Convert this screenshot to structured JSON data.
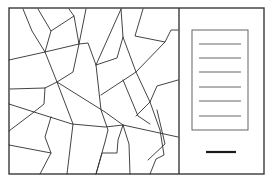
{
  "figure": {
    "width": 272,
    "height": 180,
    "background": "#ffffff",
    "line_color": "#2f2f2f",
    "frame": {
      "x": 9,
      "y": 8,
      "width": 255,
      "height": 166
    },
    "divider_x": 179
  },
  "map": {
    "polylines": [
      [
        [
          23,
          9
        ],
        [
          32,
          31
        ],
        [
          45,
          52
        ],
        [
          57,
          82
        ],
        [
          73,
          124
        ],
        [
          67,
          174
        ]
      ],
      [
        [
          38,
          9
        ],
        [
          51,
          31
        ],
        [
          74,
          16
        ],
        [
          69,
          9
        ]
      ],
      [
        [
          51,
          31
        ],
        [
          45,
          52
        ]
      ],
      [
        [
          74,
          16
        ],
        [
          79,
          44
        ],
        [
          73,
          72
        ],
        [
          57,
          82
        ],
        [
          45,
          88
        ],
        [
          10,
          89
        ]
      ],
      [
        [
          86,
          9
        ],
        [
          79,
          44
        ]
      ],
      [
        [
          9,
          60
        ],
        [
          45,
          52
        ],
        [
          79,
          44
        ],
        [
          88,
          43
        ],
        [
          96,
          65
        ],
        [
          101,
          110
        ],
        [
          108,
          130
        ],
        [
          105,
          142
        ],
        [
          96,
          174
        ]
      ],
      [
        [
          121,
          9
        ],
        [
          96,
          65
        ]
      ],
      [
        [
          121,
          9
        ],
        [
          123,
          37
        ],
        [
          117,
          58
        ],
        [
          96,
          65
        ]
      ],
      [
        [
          143,
          9
        ],
        [
          135,
          36
        ],
        [
          165,
          42
        ],
        [
          171,
          30
        ],
        [
          178,
          30
        ]
      ],
      [
        [
          123,
          37
        ],
        [
          136,
          72
        ],
        [
          150,
          102
        ],
        [
          160,
          130
        ],
        [
          164,
          155
        ],
        [
          156,
          159
        ],
        [
          150,
          174
        ]
      ],
      [
        [
          165,
          42
        ],
        [
          136,
          72
        ],
        [
          101,
          95
        ]
      ],
      [
        [
          9,
          104
        ],
        [
          34,
          112
        ],
        [
          44,
          104
        ],
        [
          45,
          88
        ]
      ],
      [
        [
          9,
          131
        ],
        [
          34,
          112
        ],
        [
          72,
          124
        ],
        [
          105,
          127
        ],
        [
          123,
          125
        ],
        [
          178,
          137
        ]
      ],
      [
        [
          57,
          82
        ],
        [
          105,
          112
        ],
        [
          123,
          125
        ]
      ],
      [
        [
          51,
          117
        ],
        [
          45,
          137
        ],
        [
          51,
          153
        ],
        [
          40,
          174
        ]
      ],
      [
        [
          9,
          145
        ],
        [
          51,
          153
        ]
      ],
      [
        [
          123,
          125
        ],
        [
          118,
          140
        ],
        [
          117,
          153
        ],
        [
          102,
          153
        ],
        [
          96,
          174
        ]
      ],
      [
        [
          123,
          125
        ],
        [
          129,
          144
        ],
        [
          130,
          174
        ]
      ],
      [
        [
          123,
          80
        ],
        [
          138,
          116
        ],
        [
          150,
          124
        ]
      ],
      [
        [
          150,
          102
        ],
        [
          157,
          86
        ],
        [
          178,
          80
        ]
      ],
      [
        [
          150,
          102
        ],
        [
          136,
          116
        ]
      ],
      [
        [
          157,
          110
        ],
        [
          165,
          144
        ],
        [
          148,
          160
        ]
      ]
    ]
  },
  "legend": {
    "box": {
      "x": 192,
      "y": 30,
      "width": 56,
      "height": 100
    },
    "entries": [
      {
        "y": 44,
        "x1": 199,
        "x2": 241
      },
      {
        "y": 58,
        "x1": 199,
        "x2": 241
      },
      {
        "y": 72,
        "x1": 199,
        "x2": 241
      },
      {
        "y": 87,
        "x1": 199,
        "x2": 241
      },
      {
        "y": 101,
        "x1": 199,
        "x2": 241
      },
      {
        "y": 116,
        "x1": 199,
        "x2": 241
      }
    ],
    "scale_bar": {
      "y": 152,
      "x1": 206,
      "x2": 236
    }
  }
}
